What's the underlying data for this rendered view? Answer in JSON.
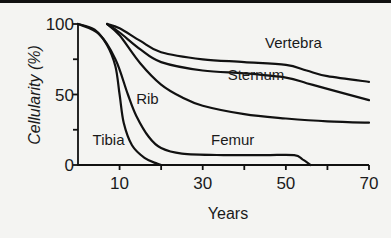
{
  "chart_data": {
    "type": "line",
    "title": "",
    "xlabel": "Years",
    "ylabel": "Cellularity (%)",
    "xlim": [
      0,
      70
    ],
    "ylim": [
      0,
      100
    ],
    "x_ticks": [
      10,
      20,
      30,
      40,
      50,
      60,
      70
    ],
    "x_tick_labels": [
      "10",
      "30",
      "50",
      "70"
    ],
    "x_tick_label_values": [
      10,
      30,
      50,
      70
    ],
    "y_ticks": [
      0,
      25,
      50,
      75,
      100
    ],
    "y_tick_labels": [
      "0",
      "50",
      "100"
    ],
    "y_tick_label_values": [
      0,
      50,
      100
    ],
    "grid": false,
    "legend": "inline labels",
    "series": [
      {
        "name": "Tibia",
        "x": [
          0,
          4,
          7,
          9,
          10,
          11,
          13,
          16,
          19,
          20
        ],
        "y": [
          100,
          96,
          85,
          70,
          50,
          30,
          14,
          5,
          1,
          0
        ]
      },
      {
        "name": "Femur",
        "x": [
          0,
          5,
          9,
          12,
          14,
          17,
          20,
          25,
          35,
          45,
          52,
          54,
          56
        ],
        "y": [
          100,
          93,
          75,
          50,
          35,
          20,
          12,
          8,
          7,
          7,
          7,
          4,
          0
        ]
      },
      {
        "name": "Rib",
        "x": [
          7,
          10,
          15,
          20,
          25,
          30,
          40,
          50,
          60,
          70
        ],
        "y": [
          100,
          92,
          72,
          57,
          48,
          42,
          36,
          33,
          31,
          30
        ]
      },
      {
        "name": "Sternum",
        "x": [
          7,
          10,
          15,
          20,
          30,
          40,
          50,
          55,
          60,
          70
        ],
        "y": [
          100,
          94,
          82,
          73,
          67,
          65,
          62,
          58,
          54,
          46
        ]
      },
      {
        "name": "Vertebra",
        "x": [
          7,
          10,
          15,
          20,
          30,
          40,
          50,
          55,
          60,
          70
        ],
        "y": [
          100,
          97,
          88,
          80,
          75,
          73,
          71,
          67,
          63,
          59
        ]
      }
    ],
    "annotations": [
      {
        "text": "Vertebra",
        "x": 45,
        "y": 83
      },
      {
        "text": "Sternum",
        "x": 36,
        "y": 60
      },
      {
        "text": "Rib",
        "x": 14,
        "y": 43
      },
      {
        "text": "Femur",
        "x": 32,
        "y": 14
      },
      {
        "text": "Tibia",
        "x": 3.5,
        "y": 14
      }
    ]
  },
  "labels": {
    "ylabel": "Cellularity (%)",
    "xlabel": "Years"
  }
}
